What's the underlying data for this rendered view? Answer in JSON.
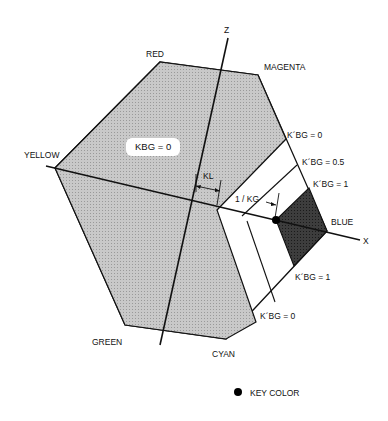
{
  "diagram": {
    "axes": {
      "z_label": "Z",
      "x_label": "X"
    },
    "vertices": {
      "red": "RED",
      "magenta": "MAGENTA",
      "yellow": "YELLOW",
      "blue": "BLUE",
      "green": "GREEN",
      "cyan": "CYAN"
    },
    "region_label": "KBG = 0",
    "annotations": {
      "kl": "KL",
      "inv_kg": "1 / KG",
      "kbg_top_0": "K´BG = 0",
      "kbg_top_05": "K´BG = 0.5",
      "kbg_top_1": "K´BG = 1",
      "kbg_bottom_1": "K´BG = 1",
      "kbg_bottom_0": "K´BG = 0"
    },
    "legend": {
      "key_color": "KEY COLOR"
    },
    "colors": {
      "gray_region": "#c4c4c4",
      "dark_region": "#3a3a3a",
      "stroke": "#111111"
    }
  }
}
